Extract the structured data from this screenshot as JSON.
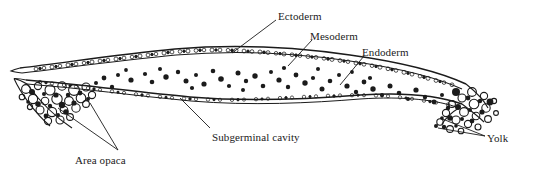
{
  "figure": {
    "ink_color": "#1b1b1b",
    "background_color": "#ffffff"
  },
  "labels": {
    "ectoderm": "Ectoderm",
    "mesoderm": "Mesoderm",
    "endoderm": "Endoderm",
    "subgerminal_cavity": "Subgerminal cavity",
    "area_opaca": "Area opaca",
    "yolk": "Yolk"
  },
  "diagram_data": {
    "type": "labelled-anatomical-section",
    "structures": [
      {
        "name": "Ectoderm",
        "description": "Dense upper epithelial cell layer forming the roof of the blastoderm",
        "leader_from": [
          276,
          20
        ],
        "leader_to": [
          232,
          53
        ]
      },
      {
        "name": "Mesoderm",
        "description": "Scattered dark stained cells dispersed between the upper and lower layers",
        "leader_from": [
          312,
          40
        ],
        "leader_to": [
          288,
          66
        ]
      },
      {
        "name": "Endoderm",
        "description": "Lower cell layer forming the floor of the blastoderm",
        "leader_from": [
          364,
          56
        ],
        "leader_to": [
          340,
          85
        ]
      },
      {
        "name": "Subgerminal cavity",
        "description": "Open space beneath the endoderm layer",
        "leader_from": [
          210,
          128
        ],
        "leader_to": [
          180,
          98
        ]
      },
      {
        "name": "Area opaca",
        "description": "Opaque peripheral wedge of yolk-laden cells at the left margin",
        "leader_from": [
          118,
          150
        ],
        "leader_to": [
          58,
          108
        ]
      },
      {
        "name": "Yolk",
        "description": "Large yolk spheres clustered at the right margin of the blastoderm",
        "leader_from": [
          485,
          136
        ],
        "leader_to": [
          440,
          118
        ]
      }
    ]
  }
}
